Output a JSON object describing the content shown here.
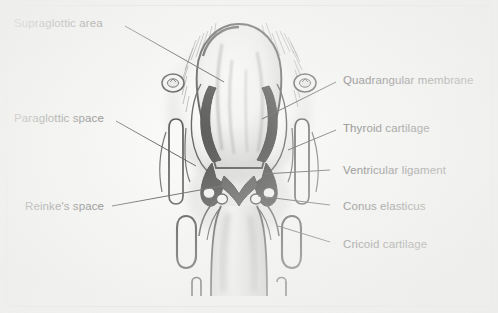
{
  "figure": {
    "background_color": "#fbfbfa",
    "ink_color": "#1b1b1b",
    "border_color": "#e2e2e0"
  },
  "labels": {
    "supraglottic_area": "Supraglottic area",
    "paraglottic_space": "Paraglottic space",
    "reinkes_space": "Reinke's space",
    "quadrangular_membrane": "Quadrangular membrane",
    "thyroid_cartilage": "Thyroid cartilage",
    "ventricular_ligament": "Ventricular ligament",
    "conus_elasticus": "Conus elasticus",
    "cricoid_cartilage": "Cricoid cartilage"
  },
  "annotations": [
    {
      "id": "supraglottic-area",
      "text": "Supraglottic area",
      "side": "left",
      "x": 14,
      "y": 17,
      "leader": [
        [
          125,
          26
        ],
        [
          224,
          82
        ]
      ]
    },
    {
      "id": "paraglottic-space",
      "text": "Paraglottic space",
      "side": "left",
      "x": 14,
      "y": 112,
      "leader": [
        [
          116,
          121
        ],
        [
          196,
          166
        ]
      ]
    },
    {
      "id": "reinkes-space",
      "text": "Reinke's space",
      "side": "left",
      "x": 25,
      "y": 200,
      "leader": [
        [
          112,
          206
        ],
        [
          222,
          186
        ]
      ]
    },
    {
      "id": "quadrangular-membrane",
      "text": "Quadrangular membrane",
      "side": "right",
      "x": 343,
      "y": 74,
      "leader": [
        [
          336,
          82
        ],
        [
          262,
          119
        ]
      ]
    },
    {
      "id": "thyroid-cartilage",
      "text": "Thyroid cartilage",
      "side": "right",
      "x": 343,
      "y": 122,
      "leader": [
        [
          336,
          130
        ],
        [
          288,
          148
        ]
      ]
    },
    {
      "id": "ventricular-ligament",
      "text": "Ventricular ligament",
      "side": "right",
      "x": 343,
      "y": 164,
      "leader": [
        [
          326,
          170
        ],
        [
          262,
          173
        ]
      ]
    },
    {
      "id": "conus-elasticus",
      "text": "Conus elasticus",
      "side": "right",
      "x": 343,
      "y": 200,
      "leader": [
        [
          326,
          205
        ],
        [
          258,
          196
        ]
      ]
    },
    {
      "id": "cricoid-cartilage",
      "text": "Cricoid cartilage",
      "side": "right",
      "x": 343,
      "y": 238,
      "leader": [
        [
          326,
          242
        ],
        [
          276,
          224
        ]
      ]
    }
  ],
  "illustration": {
    "type": "anatomical-line-drawing",
    "subject": "larynx-coronal-section",
    "structures": [
      "epiglottis",
      "aryepiglottic-fold",
      "quadrangular-membrane",
      "thyroid-cartilage",
      "ventricular-ligament",
      "laryngeal-ventricle",
      "vocal-fold",
      "conus-elasticus",
      "cricoid-cartilage",
      "trachea"
    ]
  }
}
